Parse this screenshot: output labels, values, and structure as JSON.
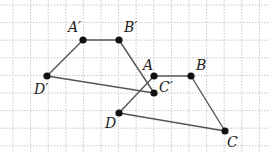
{
  "diagram": {
    "type": "geometry-grid",
    "grid": {
      "spacing": 17.6,
      "x0": 13,
      "y0": 5,
      "cols": 15,
      "rows": 9,
      "color": "#c8c8c8"
    },
    "line_color": "#555555",
    "point_color": "#111111",
    "points": {
      "A_prime": {
        "label": "A′",
        "x": 83,
        "y": 40
      },
      "B_prime": {
        "label": "B′",
        "x": 119,
        "y": 40
      },
      "C_prime": {
        "label": "C′",
        "x": 154,
        "y": 93
      },
      "D_prime": {
        "label": "D′",
        "x": 47,
        "y": 76
      },
      "A": {
        "label": "A",
        "x": 154,
        "y": 76
      },
      "B": {
        "label": "B",
        "x": 191,
        "y": 76
      },
      "C": {
        "label": "C",
        "x": 225,
        "y": 131
      },
      "D": {
        "label": "D",
        "x": 119,
        "y": 113
      }
    },
    "segments": [
      [
        "A_prime",
        "B_prime"
      ],
      [
        "B_prime",
        "C_prime"
      ],
      [
        "C_prime",
        "D_prime"
      ],
      [
        "D_prime",
        "A_prime"
      ],
      [
        "A",
        "B"
      ],
      [
        "B",
        "C"
      ],
      [
        "C",
        "D"
      ],
      [
        "D",
        "A"
      ]
    ]
  }
}
